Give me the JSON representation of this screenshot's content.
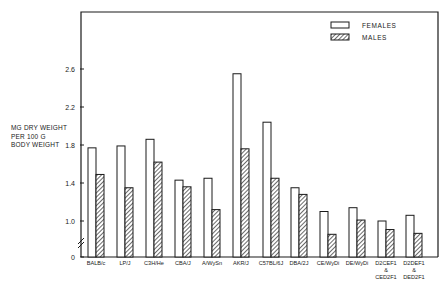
{
  "chart_data": {
    "type": "bar",
    "title": "",
    "xlabel": "",
    "ylabel": [
      "MG DRY WEIGHT",
      "PER 100 G",
      "BODY WEIGHT"
    ],
    "ylim": [
      0,
      2.6
    ],
    "yticks": [
      {
        "label": "0",
        "value": 0
      },
      {
        "label": "1.0",
        "value": 1.0
      },
      {
        "label": "1.4",
        "value": 1.4
      },
      {
        "label": "1.8",
        "value": 1.8
      },
      {
        "label": "2.2",
        "value": 2.2
      },
      {
        "label": "2.6",
        "value": 2.6
      }
    ],
    "axis_break": true,
    "grid": false,
    "legend_position": "top-right",
    "categories": [
      [
        "BALB/c"
      ],
      [
        "LP/J"
      ],
      [
        "C3H/He"
      ],
      [
        "CBA/J"
      ],
      [
        "A/WySn"
      ],
      [
        "AKR/J"
      ],
      [
        "C57BL/6J"
      ],
      [
        "DBA/2J"
      ],
      [
        "CE/WyDi"
      ],
      [
        "DE/WyDi"
      ],
      [
        "D2CEF1",
        "&",
        "CED2F1"
      ],
      [
        "D2DEF1",
        "&",
        "DED2F1"
      ]
    ],
    "series": [
      {
        "name": "FEMALES",
        "pattern": "open",
        "values": [
          1.77,
          1.79,
          1.86,
          1.43,
          1.45,
          2.55,
          2.04,
          1.35,
          1.1,
          1.14,
          1.0,
          1.06
        ]
      },
      {
        "name": "MALES",
        "pattern": "hatched",
        "values": [
          1.49,
          1.35,
          1.62,
          1.36,
          1.12,
          1.76,
          1.45,
          1.28,
          0.86,
          1.01,
          0.91,
          0.87
        ]
      }
    ]
  },
  "colors": {
    "ink": "#1a1a1a",
    "background": "#ffffff"
  }
}
